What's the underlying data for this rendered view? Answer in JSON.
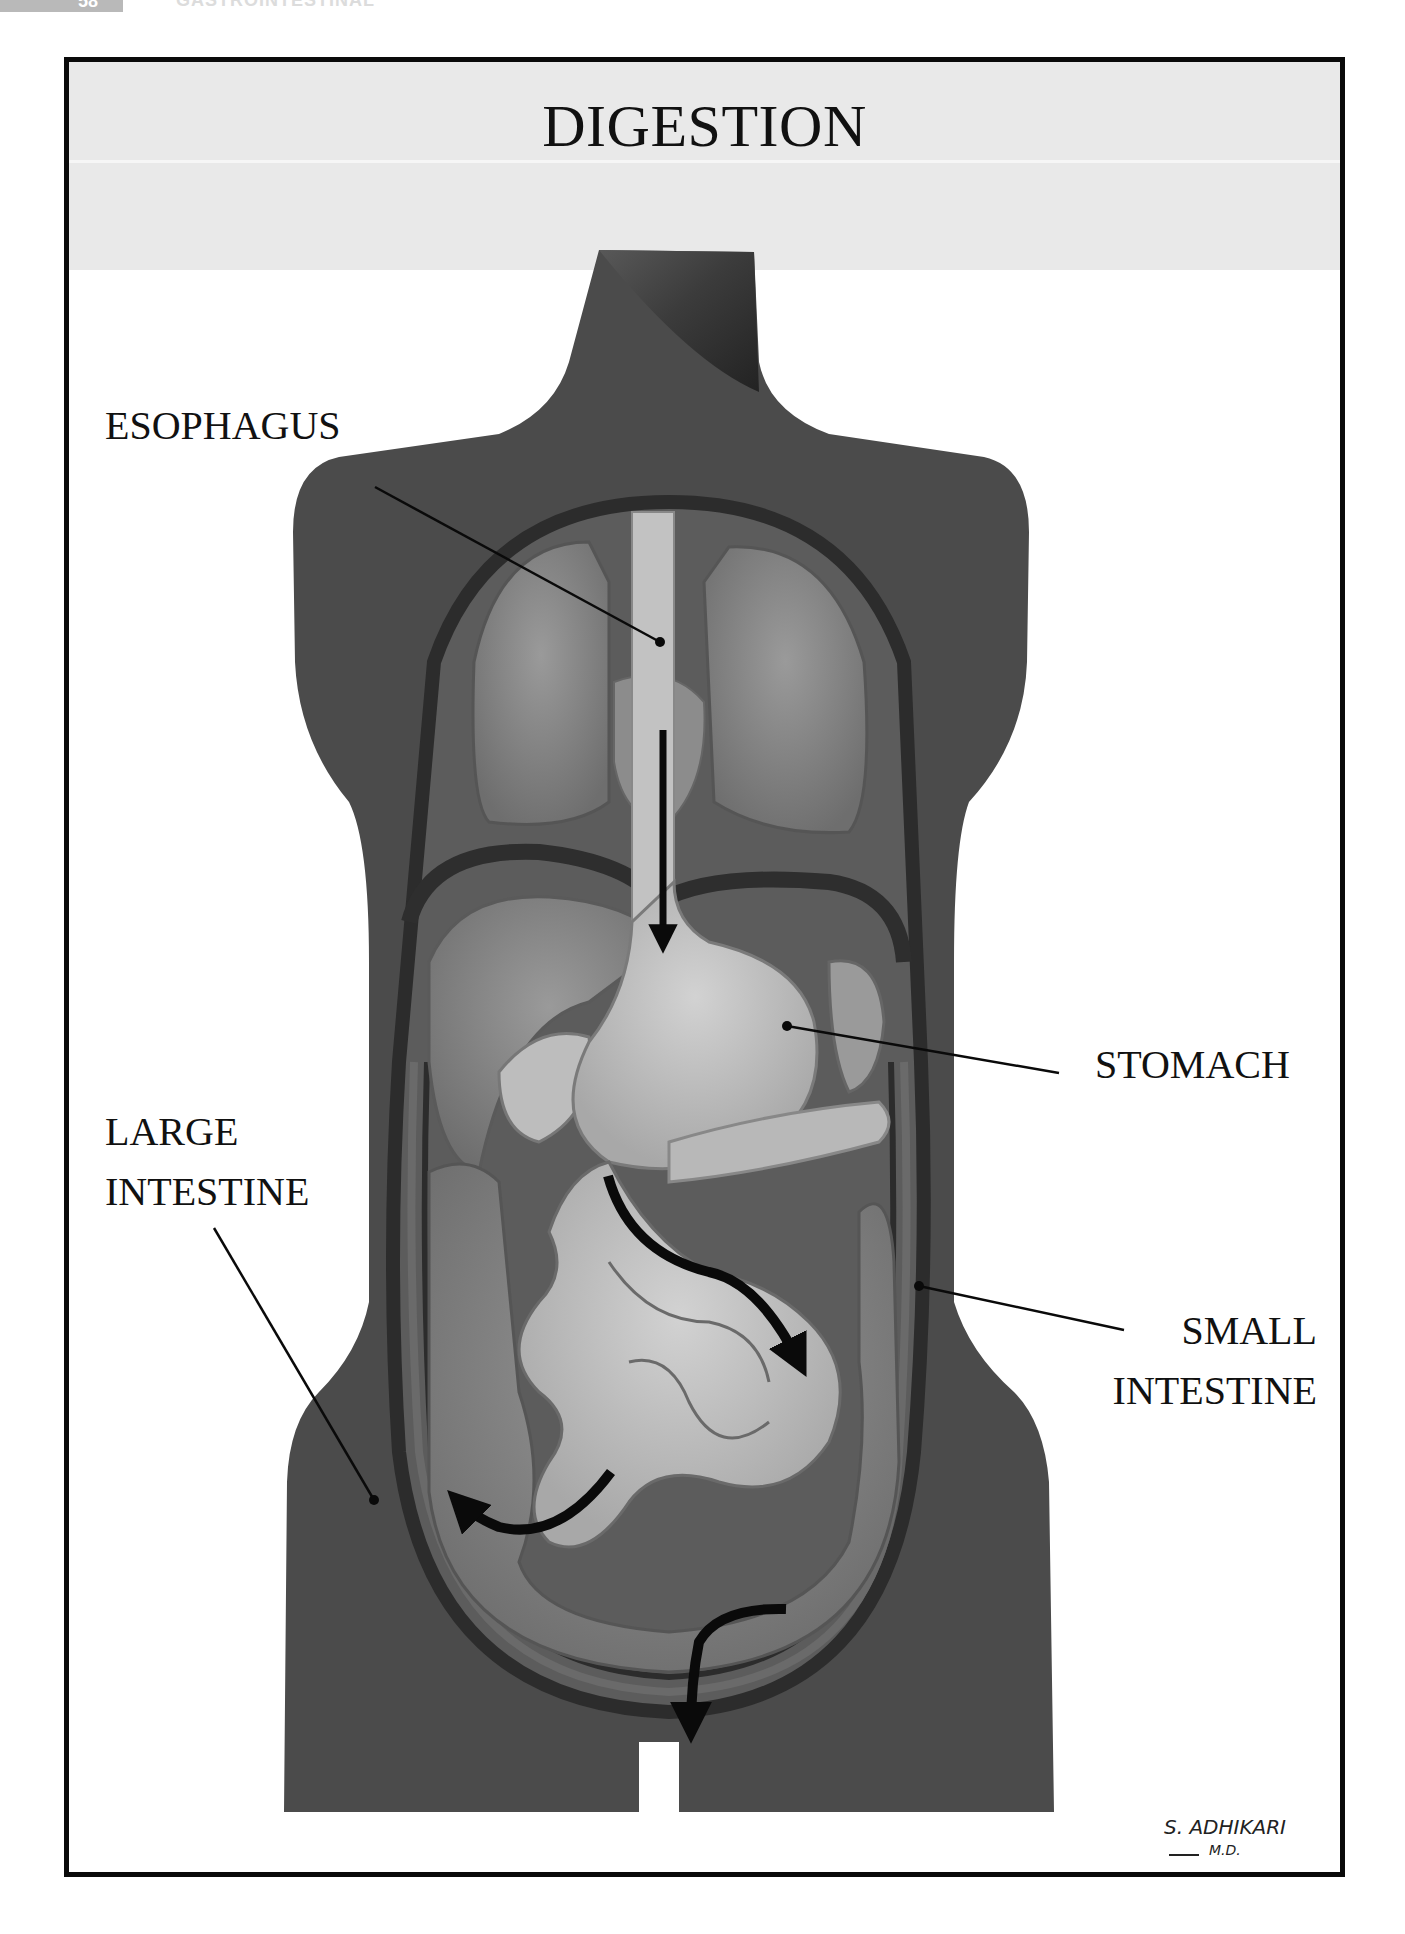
{
  "page_header": {
    "page_number": "58",
    "running_head": "GASTROINTESTINAL"
  },
  "figure": {
    "title": "DIGESTION",
    "labels": {
      "esophagus": "ESOPHAGUS",
      "stomach": "STOMACH",
      "large_intestine_line1": "LARGE",
      "large_intestine_line2": "INTESTINE",
      "small_intestine_line1": "SMALL",
      "small_intestine_line2": "INTESTINE"
    },
    "arrows": [
      {
        "name": "esophagus-down-arrow",
        "direction": "down"
      },
      {
        "name": "small-intestine-flow-arrow",
        "direction": "down-right"
      },
      {
        "name": "large-intestine-flow-arrow",
        "direction": "up-left"
      },
      {
        "name": "lower-colon-flow-arrow",
        "direction": "down"
      }
    ],
    "signature": {
      "name": "S. ADHIKARI",
      "credential": "M.D."
    }
  },
  "colors": {
    "frame": "#0a0a0a",
    "title_band": "#e9e9e9",
    "body_silhouette": "#4a4a4a",
    "organ_light": "#bdbdbd",
    "organ_mid": "#8a8a8a",
    "arrow": "#0a0a0a"
  }
}
